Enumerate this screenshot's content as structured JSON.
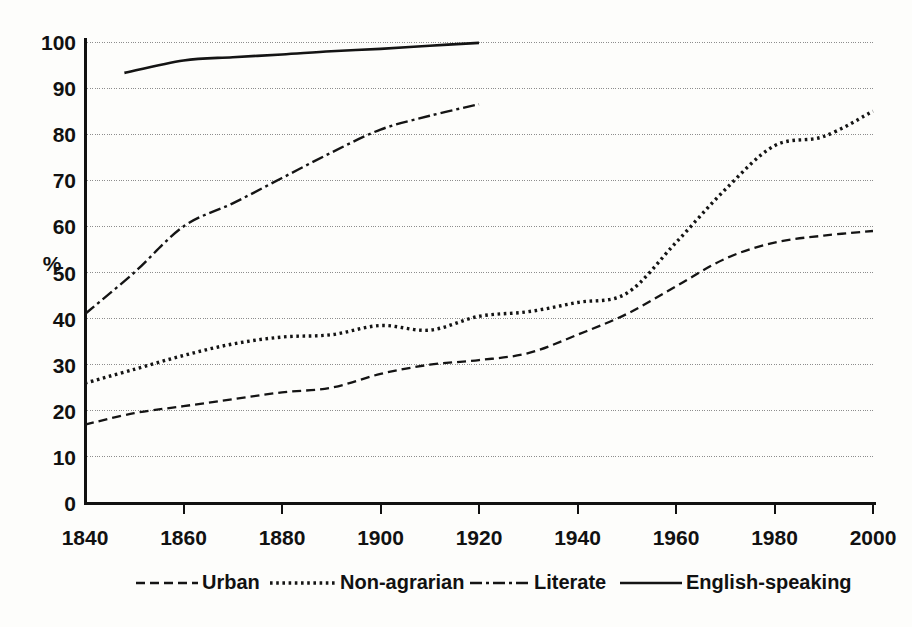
{
  "chart_data": {
    "type": "line",
    "title": "",
    "subtitle": "",
    "xlabel": "",
    "ylabel": "%",
    "xlim": [
      1840,
      2000
    ],
    "ylim": [
      0,
      100
    ],
    "grid": true,
    "legend_position": "bottom",
    "x_ticks": [
      "1840",
      "1860",
      "1880",
      "1900",
      "1920",
      "1940",
      "1960",
      "1980",
      "2000"
    ],
    "y_ticks": [
      "0",
      "10",
      "20",
      "30",
      "40",
      "50",
      "60",
      "70",
      "80",
      "90",
      "100"
    ],
    "series": [
      {
        "name": "Urban",
        "style": "dashed",
        "x": [
          1840,
          1850,
          1860,
          1870,
          1880,
          1890,
          1900,
          1910,
          1920,
          1930,
          1940,
          1950,
          1960,
          1970,
          1980,
          1990,
          2000
        ],
        "values": [
          17,
          19.5,
          21,
          22.5,
          24,
          25,
          28,
          30,
          31,
          32.5,
          36.5,
          41,
          47,
          53,
          56.5,
          58,
          59
        ]
      },
      {
        "name": "Non-agrarian",
        "style": "dotted",
        "x": [
          1840,
          1850,
          1860,
          1870,
          1880,
          1890,
          1900,
          1910,
          1920,
          1930,
          1940,
          1950,
          1960,
          1970,
          1980,
          1990,
          2000
        ],
        "values": [
          26,
          29,
          32,
          34.5,
          36,
          36.5,
          38.5,
          37.5,
          40.5,
          41.5,
          43.5,
          45.5,
          56.5,
          68,
          77.5,
          79.5,
          85
        ]
      },
      {
        "name": "Literate",
        "style": "dash-dot",
        "x": [
          1840,
          1850,
          1860,
          1870,
          1880,
          1890,
          1900,
          1910,
          1920
        ],
        "values": [
          41,
          50,
          60,
          65,
          70.5,
          76,
          81,
          84,
          86.5
        ]
      },
      {
        "name": "English-speaking",
        "style": "solid",
        "x": [
          1848,
          1860,
          1870,
          1880,
          1890,
          1900,
          1910,
          1920
        ],
        "values": [
          93.3,
          96,
          96.7,
          97.3,
          98,
          98.5,
          99.2,
          99.8
        ]
      }
    ]
  },
  "legend": {
    "items": [
      {
        "label": "Urban",
        "style": "dashed"
      },
      {
        "label": "Non-agrarian",
        "style": "dotted"
      },
      {
        "label": "Literate",
        "style": "dash-dot"
      },
      {
        "label": "English-speaking",
        "style": "solid"
      }
    ]
  },
  "colors": {
    "ink": "#141414",
    "grid": "#8d8d8d",
    "background": "#fdfdfb"
  }
}
